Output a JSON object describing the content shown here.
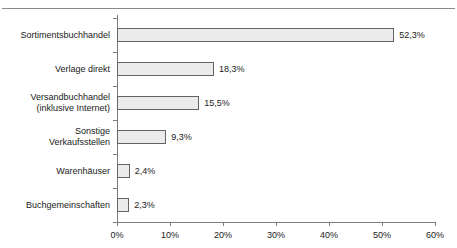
{
  "chart_data": {
    "type": "bar",
    "orientation": "horizontal",
    "title": "",
    "xlabel": "",
    "ylabel": "",
    "categories": [
      "Sortimentsbuchhandel",
      "Verlage direkt",
      "Versandbuchhandel\n(inklusive Internet)",
      "Sonstige\nVerkaufsstellen",
      "Warenhäuser",
      "Buchgemeinschaften"
    ],
    "values": [
      52.3,
      18.3,
      15.5,
      9.3,
      2.4,
      2.3
    ],
    "value_labels": [
      "52,3%",
      "18,3%",
      "15,5%",
      "9,3%",
      "2,4%",
      "2,3%"
    ],
    "xlim": [
      0,
      60
    ],
    "xticks": [
      0,
      10,
      20,
      30,
      40,
      50,
      60
    ],
    "xtick_labels": [
      "0%",
      "10%",
      "20%",
      "30%",
      "40%",
      "50%",
      "60%"
    ],
    "grid": false,
    "legend": null,
    "bar_fill_color": "#ebebeb",
    "bar_border_color": "#636363",
    "axis_color": "#7d7d7d",
    "text_color": "#1a1a1a"
  }
}
